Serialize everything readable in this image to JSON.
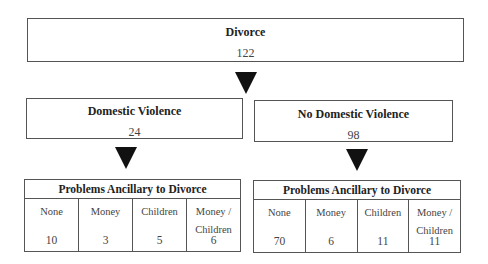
{
  "root": {
    "title": "Divorce",
    "value": "122"
  },
  "branches": [
    {
      "title": "Domestic Violence",
      "value": "24",
      "table": {
        "header": "Problems Ancillary to Divorce",
        "columns": [
          "None",
          "Money",
          "Children",
          "Money / Children"
        ],
        "values": [
          "10",
          "3",
          "5",
          "6"
        ]
      }
    },
    {
      "title": "No Domestic Violence",
      "value": "98",
      "table": {
        "header": "Problems Ancillary to Divorce",
        "columns": [
          "None",
          "Money",
          "Children",
          "Money / Children"
        ],
        "values": [
          "70",
          "6",
          "11",
          "11"
        ]
      }
    }
  ],
  "icons": {
    "arrow": "down-triangle-arrow"
  }
}
